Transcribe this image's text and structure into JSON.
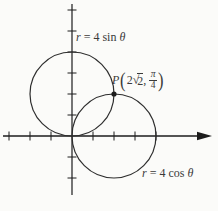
{
  "figure": {
    "type": "polar-curve-diagram",
    "background_color": "#fbfbf9",
    "axis_color": "#1c1c1c",
    "curve_color": "#2e2e2e",
    "text_color": "#3a3a3a",
    "curves": [
      {
        "equation": "r = 4 sin θ",
        "shape": "circle",
        "center_units": [
          0,
          2
        ],
        "radius_units": 2
      },
      {
        "equation": "r = 4 cos θ",
        "shape": "circle",
        "center_units": [
          2,
          0
        ],
        "radius_units": 2
      }
    ],
    "intersection_point": {
      "name": "P",
      "polar_coordinates": "(2√2, π/4)",
      "cartesian_units": [
        2,
        2
      ]
    },
    "axes": {
      "x_tick_units": [
        -3,
        -2,
        -1,
        1,
        2,
        3,
        4
      ],
      "y_tick_units": [
        -2,
        -1,
        1,
        2,
        3,
        4,
        5,
        6
      ],
      "x_arrow": "right"
    }
  },
  "labels": {
    "sin": {
      "r": "r",
      "mid": "= 4 sin",
      "theta": "θ"
    },
    "cos": {
      "r": "r",
      "mid": "= 4 cos",
      "theta": "θ"
    },
    "point": {
      "name": "P",
      "open": "(",
      "coef": "2",
      "sqrt": "√",
      "radicand": "2",
      "comma": ",",
      "num": "π",
      "den": "4",
      "close": ")"
    }
  }
}
